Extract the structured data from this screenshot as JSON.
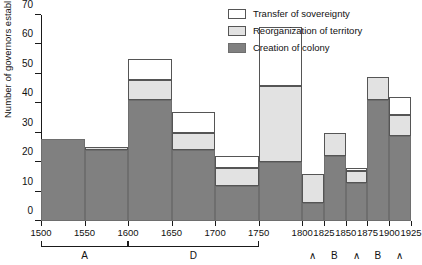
{
  "chart_data": {
    "type": "bar",
    "title": "",
    "xlabel": "",
    "ylabel": "Number of governors established",
    "stacked": true,
    "ylim": [
      0,
      70
    ],
    "yticks": [
      0,
      10,
      20,
      30,
      40,
      50,
      60,
      70
    ],
    "xlim": [
      1500,
      1925
    ],
    "xticks": [
      1500,
      1550,
      1600,
      1650,
      1700,
      1750,
      1800,
      1825,
      1850,
      1875,
      1900,
      1925
    ],
    "grid": false,
    "legend_position": "top-right",
    "bin_edges": [
      1500,
      1550,
      1600,
      1650,
      1700,
      1750,
      1800,
      1825,
      1850,
      1875,
      1900,
      1925
    ],
    "categories": [
      "1500-1550",
      "1550-1600",
      "1600-1650",
      "1650-1700",
      "1700-1750",
      "1750-1800",
      "1800-1825",
      "1825-1850",
      "1850-1875",
      "1875-1900",
      "1900-1925"
    ],
    "series": [
      {
        "name": "Creation of colony",
        "color": "#808080",
        "values": [
          28,
          24,
          41,
          24,
          12,
          20,
          6,
          22,
          13,
          41,
          29
        ]
      },
      {
        "name": "Reorganization of territory",
        "color": "#e2e2e2",
        "values": [
          0,
          1,
          7,
          6,
          6,
          26,
          10,
          8,
          4,
          8,
          7
        ]
      },
      {
        "name": "Transfer of sovereignty",
        "color": "#ffffff",
        "values": [
          0,
          0,
          7,
          7,
          4,
          20,
          0,
          0,
          1,
          0,
          6
        ]
      }
    ],
    "totals": [
      28,
      25,
      55,
      37,
      22,
      66,
      16,
      30,
      18,
      49,
      42
    ],
    "annotations": [
      {
        "label": "A",
        "type": "bracket",
        "from": 1500,
        "to": 1600
      },
      {
        "label": "D",
        "type": "bracket",
        "from": 1600,
        "to": 1750
      },
      {
        "label": "∧",
        "type": "text",
        "at": 1812
      },
      {
        "label": "B",
        "type": "text",
        "at": 1837
      },
      {
        "label": "∧",
        "type": "text",
        "at": 1862
      },
      {
        "label": "B",
        "type": "text",
        "at": 1887
      },
      {
        "label": "∧",
        "type": "text",
        "at": 1912
      }
    ]
  },
  "legend": {
    "items": [
      {
        "label": "Transfer of sovereignty",
        "swatch": "transfer"
      },
      {
        "label": "Reorganization of territory",
        "swatch": "reorg"
      },
      {
        "label": "Creation of colony",
        "swatch": "create"
      }
    ]
  }
}
